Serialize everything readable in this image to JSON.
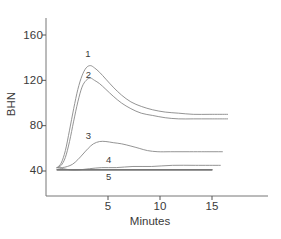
{
  "chart_data": {
    "type": "line",
    "title": "",
    "xlabel": "Minutes",
    "ylabel": "BHN",
    "xlim": [
      0,
      17.5
    ],
    "ylim": [
      28,
      175
    ],
    "xticks": [
      5,
      10,
      15
    ],
    "yticks": [
      40,
      80,
      120,
      160
    ],
    "grid": false,
    "legend": "inline-curve-numbers",
    "series": [
      {
        "name": "1",
        "label": "1",
        "label_x": 3.0,
        "label_y": 143,
        "points": [
          [
            0.1,
            43
          ],
          [
            0.5,
            47
          ],
          [
            0.9,
            58
          ],
          [
            1.3,
            76
          ],
          [
            1.7,
            95
          ],
          [
            2.1,
            112
          ],
          [
            2.5,
            124
          ],
          [
            2.9,
            131
          ],
          [
            3.3,
            133
          ],
          [
            3.7,
            131
          ],
          [
            4.2,
            127
          ],
          [
            4.8,
            121
          ],
          [
            5.5,
            114
          ],
          [
            6.3,
            107
          ],
          [
            7.2,
            101
          ],
          [
            8.2,
            97
          ],
          [
            9.3,
            94
          ],
          [
            10.5,
            92
          ],
          [
            11.8,
            91
          ],
          [
            13.2,
            90
          ],
          [
            14.8,
            90
          ],
          [
            16.5,
            90
          ],
          [
            18.5,
            90
          ]
        ]
      },
      {
        "name": "2",
        "label": "2",
        "label_x": 3.05,
        "label_y": 125,
        "points": [
          [
            0.1,
            43
          ],
          [
            0.5,
            45
          ],
          [
            0.9,
            52
          ],
          [
            1.3,
            66
          ],
          [
            1.7,
            84
          ],
          [
            2.1,
            101
          ],
          [
            2.5,
            114
          ],
          [
            2.9,
            120
          ],
          [
            3.3,
            122
          ],
          [
            3.7,
            120
          ],
          [
            4.2,
            117
          ],
          [
            4.8,
            112
          ],
          [
            5.5,
            106
          ],
          [
            6.3,
            100
          ],
          [
            7.2,
            95
          ],
          [
            8.2,
            91
          ],
          [
            9.3,
            89
          ],
          [
            10.5,
            87
          ],
          [
            11.8,
            86
          ],
          [
            13.2,
            86
          ],
          [
            14.8,
            86
          ],
          [
            16.5,
            86
          ],
          [
            18.5,
            86
          ]
        ]
      },
      {
        "name": "3",
        "label": "3",
        "label_x": 3.05,
        "label_y": 71,
        "points": [
          [
            0.1,
            43
          ],
          [
            0.6,
            43
          ],
          [
            1.1,
            44
          ],
          [
            1.6,
            46
          ],
          [
            2.1,
            50
          ],
          [
            2.6,
            55
          ],
          [
            3.1,
            60
          ],
          [
            3.6,
            64
          ],
          [
            4.2,
            66
          ],
          [
            4.8,
            66
          ],
          [
            5.5,
            65
          ],
          [
            6.3,
            64
          ],
          [
            7.2,
            62
          ],
          [
            8.0,
            60
          ],
          [
            8.8,
            58
          ],
          [
            9.8,
            57
          ],
          [
            11.0,
            57
          ],
          [
            12.5,
            57
          ],
          [
            14.0,
            57
          ],
          [
            16.0,
            57
          ],
          [
            18.5,
            57
          ]
        ]
      },
      {
        "name": "4",
        "label": "4",
        "label_x": 5.0,
        "label_y": 50,
        "points": [
          [
            0.1,
            43
          ],
          [
            0.7,
            42
          ],
          [
            1.4,
            41
          ],
          [
            2.2,
            41
          ],
          [
            3.2,
            42
          ],
          [
            4.4,
            43
          ],
          [
            5.8,
            43
          ],
          [
            7.4,
            44
          ],
          [
            9.2,
            44
          ],
          [
            11.2,
            45
          ],
          [
            13.4,
            45
          ],
          [
            15.8,
            45
          ],
          [
            18.5,
            45
          ]
        ]
      },
      {
        "name": "5",
        "label": "5",
        "label_x": 5.0,
        "label_y": 35,
        "points": [
          [
            0.1,
            41
          ],
          [
            2.5,
            41
          ],
          [
            5.0,
            41
          ],
          [
            7.5,
            41
          ],
          [
            10.0,
            41
          ],
          [
            12.5,
            41
          ],
          [
            15.0,
            41
          ],
          [
            18.5,
            41
          ]
        ]
      }
    ]
  },
  "axes": {
    "y_tick_labels": [
      "160",
      "120",
      "80",
      "40"
    ],
    "x_tick_labels": [
      "5",
      "10",
      "15"
    ],
    "y_axis_title": "BHN",
    "x_axis_title": "Minutes"
  },
  "colors": {
    "axis": "#555555",
    "curve": "#888888",
    "curve_bold": "#777777",
    "text": "#3a3a3a",
    "background": "#ffffff"
  }
}
